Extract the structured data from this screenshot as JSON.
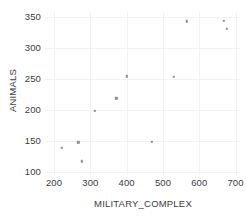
{
  "chart_data": {
    "type": "scatter",
    "title": "",
    "xlabel": "MILITARY_COMPLEX",
    "ylabel": "ANIMALS",
    "xlim": [
      175,
      715
    ],
    "ylim": [
      95,
      358
    ],
    "xticks": [
      200,
      300,
      400,
      500,
      600,
      700
    ],
    "yticks": [
      100,
      150,
      200,
      250,
      300,
      350
    ],
    "xticklabels": [
      "200",
      "300",
      "400",
      "500",
      "600",
      "700"
    ],
    "yticklabels": [
      "100",
      "150",
      "200",
      "250",
      "300",
      "350"
    ],
    "grid": true,
    "grid_color": "#f2f2f2",
    "marker_color": "#8e8e93",
    "marker_size": 2.4,
    "background": "#ffffff",
    "legend": null,
    "n_points": 11,
    "points": [
      {
        "x": 222,
        "y": 139
      },
      {
        "x": 267,
        "y": 148
      },
      {
        "x": 276,
        "y": 117
      },
      {
        "x": 313,
        "y": 199
      },
      {
        "x": 371,
        "y": 219
      },
      {
        "x": 401,
        "y": 254
      },
      {
        "x": 530,
        "y": 253
      },
      {
        "x": 565,
        "y": 343
      },
      {
        "x": 668,
        "y": 344
      },
      {
        "x": 676,
        "y": 331
      },
      {
        "x": 470,
        "y": 149
      }
    ],
    "series": [
      {
        "name": "observations",
        "x": [
          222,
          267,
          276,
          313,
          371,
          401,
          530,
          565,
          668,
          676,
          470
        ],
        "y": [
          139,
          148,
          117,
          199,
          219,
          254,
          253,
          343,
          344,
          331,
          149
        ]
      }
    ]
  },
  "axis": {
    "x_title": "MILITARY_COMPLEX",
    "y_title": "ANIMALS"
  }
}
